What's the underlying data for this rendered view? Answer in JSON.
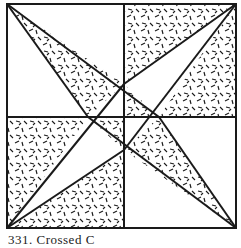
{
  "figure": {
    "type": "quilt-block-diagram",
    "caption": "331. Crossed C",
    "colors": {
      "line": "#1a1a1a",
      "background": "#ffffff",
      "hatch": "#1a1a1a"
    },
    "frame": {
      "x1": 7,
      "y1": 4,
      "x2": 236,
      "y2": 228
    },
    "midlines": {
      "vertical_x": 124,
      "horizontal_y": 117
    },
    "center_points": {
      "top": [
        124,
        84
      ],
      "left": [
        88,
        117
      ],
      "right": [
        159,
        117
      ],
      "bottom": [
        124,
        150
      ]
    },
    "shaded_regions": [
      "top-left kite blade",
      "top-right quadrant upper wedge",
      "top-right quadrant lower wedge",
      "bottom-left quadrant upper wedge",
      "bottom-left quadrant lower wedge",
      "bottom-right kite blade",
      "center small triangles"
    ]
  }
}
